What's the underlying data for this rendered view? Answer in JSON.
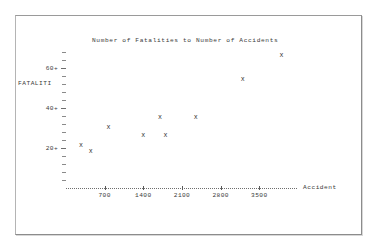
{
  "window": {
    "background_color": "#ffffff",
    "frame_border_color": "#9a9a9a"
  },
  "chart_data": {
    "type": "scatter",
    "title": "Number of Fatalities to Number of Accidents",
    "xlabel": "Accident",
    "ylabel": "FATALITI",
    "marker_symbol": "x",
    "grid": false,
    "legend": "none",
    "xlim": [
      0,
      4200
    ],
    "ylim": [
      0,
      72
    ],
    "xticks": [
      700,
      1400,
      2100,
      2800,
      3500
    ],
    "xtick_labels": [
      "700",
      "1400",
      "2100",
      "2800",
      "3500"
    ],
    "yticks": [
      20,
      40,
      60
    ],
    "ytick_labels": [
      "20+",
      "40+",
      "60+"
    ],
    "y_minor_tick_count": 17,
    "points": [
      {
        "x": 270,
        "y": 21
      },
      {
        "x": 450,
        "y": 18
      },
      {
        "x": 770,
        "y": 30
      },
      {
        "x": 1400,
        "y": 26
      },
      {
        "x": 1700,
        "y": 35
      },
      {
        "x": 1800,
        "y": 26
      },
      {
        "x": 2350,
        "y": 35
      },
      {
        "x": 3200,
        "y": 54
      },
      {
        "x": 3900,
        "y": 66
      }
    ],
    "series": [
      {
        "name": "Fatalities vs Accidents",
        "x": [
          270,
          450,
          770,
          1400,
          1700,
          1800,
          2350,
          3200,
          3900
        ],
        "values": [
          21,
          18,
          30,
          26,
          35,
          26,
          35,
          54,
          66
        ]
      }
    ]
  },
  "axis_labels": {
    "y_axis_name": "FATALITI",
    "x_axis_name": "Accident"
  }
}
